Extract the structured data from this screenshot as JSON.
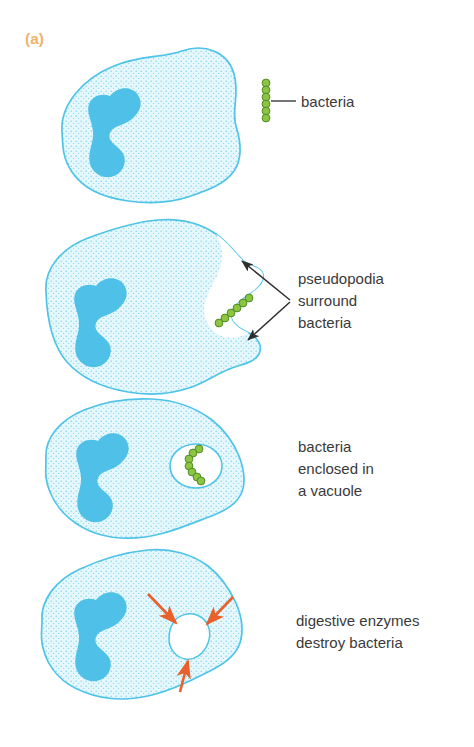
{
  "figure": {
    "panel_letter": "(a)",
    "process": "phagocytosis",
    "accent_colors": {
      "panel_letter": "#F0B26B",
      "cell_outline": "#4FC3E8",
      "cytoplasm_fill": "#E2F7FC",
      "cytoplasm_stipple": "#7FD4EC",
      "nucleus": "#4FC0E8",
      "bacteria_fill": "#8CC63F",
      "bacteria_outline": "#4E8B2A",
      "vacuole_fill": "#FFFFFF",
      "leader_line": "#3a3a3a",
      "enzyme_arrow": "#E8602C",
      "label_text": "#3a3a3a"
    }
  },
  "stages": [
    {
      "id": "stage-1",
      "label_lines": [
        "bacteria"
      ],
      "bacteria_count": 8,
      "bacteria_layout": "vertical-chain-outside-cell",
      "has_vacuole": false,
      "has_pseudopodia": false,
      "leader": "line"
    },
    {
      "id": "stage-2",
      "label_lines": [
        "pseudopodia",
        "surround",
        "bacteria"
      ],
      "bacteria_count": 6,
      "bacteria_layout": "diagonal-chain-in-cleft",
      "has_vacuole": false,
      "has_pseudopodia": true,
      "leader": "two-arrows"
    },
    {
      "id": "stage-3",
      "label_lines": [
        "bacteria",
        "enclosed in",
        "a vacuole"
      ],
      "bacteria_count": 7,
      "bacteria_layout": "curved-chain-in-vacuole",
      "has_vacuole": true,
      "has_pseudopodia": false,
      "leader": "none"
    },
    {
      "id": "stage-4",
      "label_lines": [
        "digestive enzymes",
        "destroy bacteria"
      ],
      "bacteria_count": 0,
      "bacteria_layout": "none",
      "has_vacuole": true,
      "has_pseudopodia": false,
      "enzyme_arrows": 3,
      "leader": "none"
    }
  ]
}
